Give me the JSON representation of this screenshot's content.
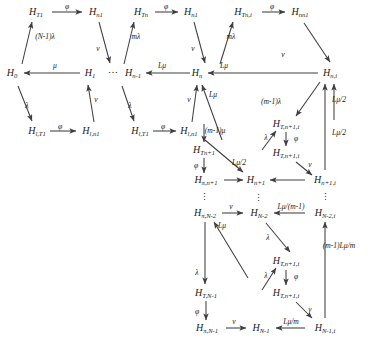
{
  "diagram": {
    "colors": {
      "edge": "#3f3f3f",
      "text": "#1a1a1a",
      "background": "#ffffff"
    },
    "nodes": [
      {
        "id": "H_T1",
        "label": "H",
        "sub": "T1",
        "x": 36,
        "y": 12
      },
      {
        "id": "H_n1a",
        "label": "H",
        "sub": "n1",
        "x": 96,
        "y": 12
      },
      {
        "id": "H_Tn",
        "label": "H",
        "sub": "Tn",
        "x": 141,
        "y": 12
      },
      {
        "id": "H_n1b",
        "label": "H",
        "sub": "n1",
        "x": 191,
        "y": 12
      },
      {
        "id": "H_Tni",
        "label": "H",
        "sub": "Tn,i",
        "x": 243,
        "y": 12
      },
      {
        "id": "H_nn1",
        "label": "H",
        "sub": "nn1",
        "x": 300,
        "y": 12
      },
      {
        "id": "H_0",
        "label": "H",
        "sub": "0",
        "x": 12,
        "y": 73
      },
      {
        "id": "H_1",
        "label": "H",
        "sub": "1",
        "x": 90,
        "y": 73
      },
      {
        "id": "H_nm1",
        "label": "H",
        "sub": "n-1",
        "x": 133,
        "y": 73
      },
      {
        "id": "H_n",
        "label": "H",
        "sub": "n",
        "x": 197,
        "y": 73
      },
      {
        "id": "H_ni",
        "label": "H",
        "sub": "n,i",
        "x": 330,
        "y": 73
      },
      {
        "id": "H_lT1a",
        "label": "H",
        "sub": "l,T1",
        "x": 37,
        "y": 131
      },
      {
        "id": "H_ln1a",
        "label": "H",
        "sub": "l,n1",
        "x": 91,
        "y": 131
      },
      {
        "id": "H_lT1b",
        "label": "H",
        "sub": "l,T1",
        "x": 140,
        "y": 131
      },
      {
        "id": "H_ln1b",
        "label": "H",
        "sub": "l,n1",
        "x": 189,
        "y": 131
      },
      {
        "id": "H_Tn1i_a",
        "label": "H",
        "sub": "T,n+1,i",
        "x": 286,
        "y": 124
      },
      {
        "id": "H_Tn1i_b",
        "label": "H",
        "sub": "T,n+1,i",
        "x": 286,
        "y": 153
      },
      {
        "id": "H_Tn1",
        "label": "H",
        "sub": "Tn+1",
        "x": 204,
        "y": 150
      },
      {
        "id": "H_pi_n1",
        "label": "H",
        "sub": "π,n+1",
        "x": 206,
        "y": 180
      },
      {
        "id": "H_n1c",
        "label": "H",
        "sub": "n+1",
        "x": 256,
        "y": 180
      },
      {
        "id": "H_n1i",
        "label": "H",
        "sub": "n+1,i",
        "x": 325,
        "y": 180
      },
      {
        "id": "H_pi_Nm2",
        "label": "H",
        "sub": "π,N-2",
        "x": 205,
        "y": 213
      },
      {
        "id": "H_Nm2",
        "label": "H",
        "sub": "N-2",
        "x": 259,
        "y": 213
      },
      {
        "id": "H_Nm2i",
        "label": "H",
        "sub": "N-2,i",
        "x": 325,
        "y": 213
      },
      {
        "id": "H_Tn1i_c",
        "label": "H",
        "sub": "T,n+1,i",
        "x": 286,
        "y": 261
      },
      {
        "id": "H_Tn1i_d",
        "label": "H",
        "sub": "T,n+1,i",
        "x": 286,
        "y": 293
      },
      {
        "id": "H_TNm1",
        "label": "H",
        "sub": "T,N-1",
        "x": 206,
        "y": 293
      },
      {
        "id": "H_pi_Nm1",
        "label": "H",
        "sub": "π,N-1",
        "x": 207,
        "y": 328
      },
      {
        "id": "H_Nm1",
        "label": "H",
        "sub": "N-1",
        "x": 261,
        "y": 328
      },
      {
        "id": "H_Nm1i",
        "label": "H",
        "sub": "N-1,i",
        "x": 325,
        "y": 328
      }
    ],
    "ellipses": [
      {
        "id": "hdots-1",
        "text": "⋯",
        "x": 113,
        "y": 72
      },
      {
        "id": "vdots-1",
        "text": "⋮",
        "x": 204,
        "y": 197
      },
      {
        "id": "vdots-2",
        "text": "⋮",
        "x": 258,
        "y": 198
      },
      {
        "id": "vdots-3",
        "text": "⋮",
        "x": 325,
        "y": 197
      }
    ],
    "edge_labels": [
      {
        "id": "phi-1",
        "text": "φ",
        "x": 67,
        "y": 7
      },
      {
        "id": "phi-2",
        "text": "φ",
        "x": 166,
        "y": 7
      },
      {
        "id": "phi-3",
        "text": "φ",
        "x": 272,
        "y": 7
      },
      {
        "id": "Nm1lam",
        "text": "(N-1)λ",
        "x": 45,
        "y": 37
      },
      {
        "id": "mlam-1",
        "text": "mλ",
        "x": 136,
        "y": 37
      },
      {
        "id": "mlam-2",
        "text": "mλ",
        "x": 231,
        "y": 37
      },
      {
        "id": "nu-1",
        "text": "ν",
        "x": 98,
        "y": 49
      },
      {
        "id": "nu-2",
        "text": "ν",
        "x": 193,
        "y": 49
      },
      {
        "id": "nu-3",
        "text": "ν",
        "x": 283,
        "y": 55
      },
      {
        "id": "mu-1",
        "text": "μ",
        "x": 55,
        "y": 66
      },
      {
        "id": "Lmu-1",
        "text": "Lμ",
        "x": 162,
        "y": 66
      },
      {
        "id": "Lmu-2",
        "text": "Lμ",
        "x": 224,
        "y": 66
      },
      {
        "id": "lam-1",
        "text": "λ",
        "x": 27,
        "y": 106
      },
      {
        "id": "lam-2",
        "text": "λ",
        "x": 130,
        "y": 106
      },
      {
        "id": "nu-4",
        "text": "ν",
        "x": 96,
        "y": 100
      },
      {
        "id": "nu-5",
        "text": "ν",
        "x": 189,
        "y": 100
      },
      {
        "id": "Lmu-3",
        "text": "Lμ",
        "x": 213,
        "y": 95
      },
      {
        "id": "Lmu2-1",
        "text": "Lμ/2",
        "x": 339,
        "y": 100
      },
      {
        "id": "mm1lam",
        "text": "(m-1)λ",
        "x": 271,
        "y": 102
      },
      {
        "id": "phi-4",
        "text": "φ",
        "x": 60,
        "y": 127
      },
      {
        "id": "phi-5",
        "text": "φ",
        "x": 163,
        "y": 127
      },
      {
        "id": "mm1mu",
        "text": "(m-1)μ",
        "x": 215,
        "y": 131
      },
      {
        "id": "lam-3",
        "text": "λ",
        "x": 266,
        "y": 138
      },
      {
        "id": "phi-6",
        "text": "φ",
        "x": 296,
        "y": 139
      },
      {
        "id": "phi-7",
        "text": "φ",
        "x": 196,
        "y": 166
      },
      {
        "id": "Lmu2-2",
        "text": "Lμ/2",
        "x": 239,
        "y": 163
      },
      {
        "id": "nu-6",
        "text": "ν",
        "x": 310,
        "y": 165
      },
      {
        "id": "Lmu2-3",
        "text": "Lμ/2",
        "x": 339,
        "y": 133
      },
      {
        "id": "nu-7",
        "text": "ν",
        "x": 231,
        "y": 207
      },
      {
        "id": "Lmum1",
        "text": "Lμ/(m-1)",
        "x": 291,
        "y": 207
      },
      {
        "id": "Lmu-4",
        "text": "Lμ",
        "x": 222,
        "y": 226
      },
      {
        "id": "lam-4",
        "text": "λ",
        "x": 268,
        "y": 238
      },
      {
        "id": "m1Lmum",
        "text": "(m-1)Lμ/m",
        "x": 339,
        "y": 246
      },
      {
        "id": "lam-5",
        "text": "λ",
        "x": 266,
        "y": 276
      },
      {
        "id": "phi-8",
        "text": "φ",
        "x": 296,
        "y": 277
      },
      {
        "id": "lam-6",
        "text": "λ",
        "x": 197,
        "y": 273
      },
      {
        "id": "phi-9",
        "text": "φ",
        "x": 197,
        "y": 312
      },
      {
        "id": "nu-8",
        "text": "ν",
        "x": 234,
        "y": 322
      },
      {
        "id": "Lmum",
        "text": "Lμ/m",
        "x": 291,
        "y": 322
      },
      {
        "id": "nu-9",
        "text": "ν",
        "x": 310,
        "y": 310
      }
    ]
  }
}
